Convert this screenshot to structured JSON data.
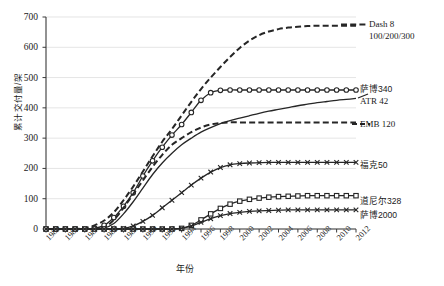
{
  "chart_data": {
    "type": "line",
    "title": "",
    "xlabel": "年份",
    "ylabel": "累计交付量/架",
    "xlim": [
      1980,
      2012
    ],
    "ylim": [
      0,
      700
    ],
    "yticks": [
      0,
      100,
      200,
      300,
      400,
      500,
      600,
      700
    ],
    "xticks": [
      1980,
      1982,
      1984,
      1986,
      1988,
      1990,
      1992,
      1994,
      1996,
      1998,
      2000,
      2002,
      2004,
      2006,
      2008,
      2010,
      2012
    ],
    "grid": true,
    "legend_position": "right-inline",
    "x": [
      1980,
      1981,
      1982,
      1983,
      1984,
      1985,
      1986,
      1987,
      1988,
      1989,
      1990,
      1991,
      1992,
      1993,
      1994,
      1995,
      1996,
      1997,
      1998,
      1999,
      2000,
      2001,
      2002,
      2003,
      2004,
      2005,
      2006,
      2007,
      2008,
      2009,
      2010,
      2011,
      2012
    ],
    "series": [
      {
        "name": "Dash 8 100/200/300",
        "label_line1": "Dash 8",
        "label_line2": "100/200/300",
        "style": "dashed",
        "marker": "none",
        "color": "#262626",
        "values": [
          0,
          0,
          0,
          0,
          3,
          12,
          28,
          55,
          95,
          140,
          190,
          240,
          288,
          330,
          375,
          420,
          462,
          500,
          535,
          568,
          598,
          622,
          640,
          652,
          660,
          665,
          668,
          670,
          671,
          671,
          671,
          671,
          671
        ]
      },
      {
        "name": "萨博340",
        "style": "solid",
        "marker": "circle-open",
        "color": "#262626",
        "values": [
          0,
          0,
          0,
          0,
          0,
          2,
          12,
          38,
          75,
          120,
          175,
          225,
          270,
          310,
          345,
          385,
          425,
          450,
          458,
          459,
          459,
          459,
          459,
          459,
          459,
          459,
          459,
          459,
          459,
          459,
          459,
          459,
          459
        ]
      },
      {
        "name": "ATR 42",
        "style": "solid",
        "marker": "none",
        "color": "#262626",
        "values": [
          0,
          0,
          0,
          0,
          0,
          0,
          3,
          18,
          50,
          90,
          135,
          180,
          218,
          250,
          278,
          300,
          320,
          335,
          348,
          358,
          366,
          374,
          382,
          389,
          395,
          401,
          407,
          412,
          417,
          421,
          425,
          428,
          431
        ]
      },
      {
        "name": "EMB 120",
        "style": "dashed",
        "marker": "none",
        "color": "#262626",
        "values": [
          0,
          0,
          0,
          0,
          0,
          0,
          5,
          30,
          70,
          115,
          160,
          205,
          245,
          278,
          300,
          320,
          335,
          345,
          350,
          352,
          352,
          352,
          352,
          352,
          352,
          352,
          352,
          352,
          352,
          352,
          352,
          352,
          352
        ]
      },
      {
        "name": "福克50",
        "style": "solid",
        "marker": "cross",
        "color": "#262626",
        "values": [
          0,
          0,
          0,
          0,
          0,
          0,
          0,
          0,
          2,
          10,
          25,
          45,
          70,
          95,
          120,
          145,
          168,
          188,
          203,
          212,
          216,
          218,
          219,
          220,
          220,
          220,
          220,
          220,
          220,
          220,
          220,
          220,
          220
        ]
      },
      {
        "name": "道尼尔328",
        "style": "solid",
        "marker": "square-open",
        "color": "#262626",
        "values": [
          0,
          0,
          0,
          0,
          0,
          0,
          0,
          0,
          0,
          0,
          0,
          0,
          0,
          0,
          2,
          12,
          30,
          50,
          68,
          82,
          92,
          98,
          102,
          105,
          107,
          108,
          109,
          110,
          110,
          110,
          110,
          110,
          110
        ]
      },
      {
        "name": "萨博2000",
        "style": "solid",
        "marker": "cross",
        "color": "#262626",
        "values": [
          0,
          0,
          0,
          0,
          0,
          0,
          0,
          0,
          0,
          0,
          0,
          0,
          0,
          0,
          2,
          10,
          22,
          34,
          44,
          51,
          55,
          58,
          60,
          61,
          62,
          63,
          63,
          63,
          63,
          63,
          63,
          63,
          63
        ]
      }
    ]
  },
  "axis": {
    "ylabel": "累计交付量/架",
    "xlabel": "年份",
    "yticks": [
      "700",
      "600",
      "500",
      "400",
      "300",
      "200",
      "100",
      "0"
    ],
    "xticks": [
      "1980",
      "1982",
      "1984",
      "1986",
      "1988",
      "1990",
      "1992",
      "1994",
      "1996",
      "1998",
      "2000",
      "2002",
      "2004",
      "2006",
      "2008",
      "2010",
      "2012"
    ]
  },
  "legend": {
    "dash8_l1": "Dash 8",
    "dash8_l2": "100/200/300",
    "saab340": "萨博340",
    "atr42": "ATR 42",
    "emb120": "EMB 120",
    "fokker50": "福克50",
    "dornier328": "道尼尔328",
    "saab2000": "萨博2000"
  }
}
